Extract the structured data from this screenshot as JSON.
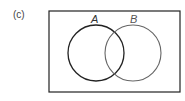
{
  "figure": {
    "label": "(c)",
    "universe": {
      "x": 49,
      "y": 11,
      "width": 131,
      "height": 81,
      "stroke": "#222222"
    },
    "sets": [
      {
        "name": "A",
        "cx": 96,
        "cy": 53,
        "r": 28,
        "stroke": "#222222",
        "label_x": 94,
        "label_y": 23
      },
      {
        "name": "B",
        "cx": 133,
        "cy": 53,
        "r": 28,
        "stroke": "#666666",
        "label_x": 134,
        "label_y": 23
      }
    ]
  }
}
